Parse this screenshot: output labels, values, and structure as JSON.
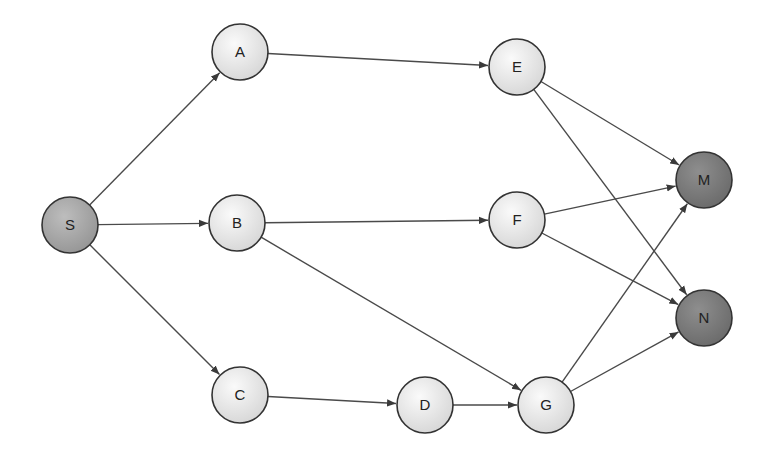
{
  "diagram": {
    "type": "directed-graph",
    "colors": {
      "edge": "#4a4a4a",
      "node_light": "#e8e8e8",
      "node_source": "#a8a8a8",
      "node_sink": "#7a7a7a",
      "node_stroke": "#333333"
    },
    "nodes": [
      {
        "id": "S",
        "label": "S",
        "x": 70,
        "y": 225,
        "kind": "source"
      },
      {
        "id": "A",
        "label": "A",
        "x": 240,
        "y": 52,
        "kind": "light"
      },
      {
        "id": "B",
        "label": "B",
        "x": 237,
        "y": 223,
        "kind": "light"
      },
      {
        "id": "C",
        "label": "C",
        "x": 240,
        "y": 395,
        "kind": "light"
      },
      {
        "id": "D",
        "label": "D",
        "x": 425,
        "y": 405,
        "kind": "light"
      },
      {
        "id": "E",
        "label": "E",
        "x": 517,
        "y": 67,
        "kind": "light"
      },
      {
        "id": "F",
        "label": "F",
        "x": 517,
        "y": 220,
        "kind": "light"
      },
      {
        "id": "G",
        "label": "G",
        "x": 546,
        "y": 405,
        "kind": "light"
      },
      {
        "id": "M",
        "label": "M",
        "x": 704,
        "y": 180,
        "kind": "sink"
      },
      {
        "id": "N",
        "label": "N",
        "x": 704,
        "y": 318,
        "kind": "sink"
      }
    ],
    "edges": [
      {
        "from": "S",
        "to": "A"
      },
      {
        "from": "S",
        "to": "B"
      },
      {
        "from": "S",
        "to": "C"
      },
      {
        "from": "A",
        "to": "E"
      },
      {
        "from": "B",
        "to": "F"
      },
      {
        "from": "B",
        "to": "G"
      },
      {
        "from": "C",
        "to": "D"
      },
      {
        "from": "D",
        "to": "G"
      },
      {
        "from": "E",
        "to": "M"
      },
      {
        "from": "E",
        "to": "N"
      },
      {
        "from": "F",
        "to": "M"
      },
      {
        "from": "F",
        "to": "N"
      },
      {
        "from": "G",
        "to": "M"
      },
      {
        "from": "G",
        "to": "N"
      }
    ],
    "node_radius": 28
  }
}
